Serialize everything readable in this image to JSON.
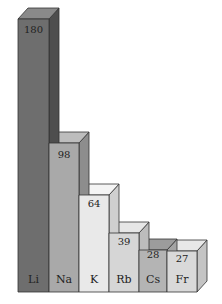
{
  "chart_data": {
    "type": "bar",
    "style": "3d",
    "title": "",
    "xlabel": "",
    "ylabel": "",
    "categories": [
      "Li",
      "Na",
      "K",
      "Rb",
      "Cs",
      "Fr"
    ],
    "values": [
      180,
      98,
      64,
      39,
      28,
      27
    ],
    "ylim": [
      0,
      180
    ],
    "grid": false,
    "legend": null,
    "bar_colors": [
      "#6e6e6e",
      "#a9a9a9",
      "#e9e9e9",
      "#d6d6d6",
      "#b4b4b4",
      "#d9d9d9"
    ],
    "bar_top_colors": [
      "#8a8a8a",
      "#bdbdbd",
      "#f4f4f4",
      "#e6e6e6",
      "#9c9c9c",
      "#e8e8e8"
    ],
    "bar_side_colors": [
      "#4e4e4e",
      "#8d8d8d",
      "#cfcfcf",
      "#bcbcbc",
      "#a3a3a3",
      "#c4c4c4"
    ]
  },
  "labels": {
    "bar0_value": "180",
    "bar0_cat": "Li",
    "bar1_value": "98",
    "bar1_cat": "Na",
    "bar2_value": "64",
    "bar2_cat": "K",
    "bar3_value": "39",
    "bar3_cat": "Rb",
    "bar4_value": "28",
    "bar4_cat": "Cs",
    "bar5_value": "27",
    "bar5_cat": "Fr"
  }
}
